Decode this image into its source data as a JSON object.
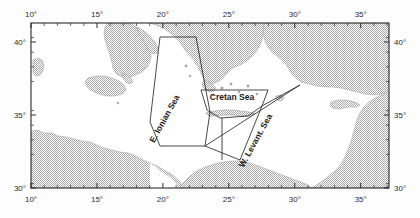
{
  "figure": {
    "kind": "map",
    "projection_note": "equirectangular",
    "background_color": "#fdfdfd",
    "sea_color": "#ffffff",
    "land_color": "#b9b9b9",
    "land_fill_style": "stipple",
    "frame_color": "#2b2b2b"
  },
  "axes": {
    "longitude": {
      "unit": "degrees",
      "min": 10,
      "max": 37.2,
      "major_ticks": [
        10,
        15,
        20,
        25,
        30,
        35
      ],
      "labels_top": [
        "10°",
        "15°",
        "20°",
        "25°",
        "30°",
        "35°"
      ],
      "labels_bottom": [
        "10°",
        "15°",
        "20°",
        "25°",
        "30°",
        "35°"
      ],
      "minor_tick_step": 1
    },
    "latitude": {
      "unit": "degrees",
      "min": 30,
      "max": 41.3,
      "major_ticks": [
        30,
        35,
        40
      ],
      "labels_left": [
        "40°",
        "35°",
        "30°"
      ],
      "labels_right": [
        "40°",
        "35°",
        "30°"
      ],
      "minor_tick_step": 1
    }
  },
  "regions": [
    {
      "id": "e-ionian-sea",
      "label": "E. Ionian Sea",
      "label_rotation_deg": -61,
      "label_x": 167,
      "label_y": 120,
      "outline_color": "#1a1a1a"
    },
    {
      "id": "cretan-sea",
      "label": "Cretan Sea",
      "label_rotation_deg": 0,
      "label_x": 232,
      "label_y": 100,
      "outline_color": "#1a1a1a"
    },
    {
      "id": "w-levantine-sea",
      "label": "W. Levant. Sea",
      "label_rotation_deg": -61,
      "label_x": 258,
      "label_y": 142,
      "outline_color": "#1a1a1a"
    }
  ]
}
